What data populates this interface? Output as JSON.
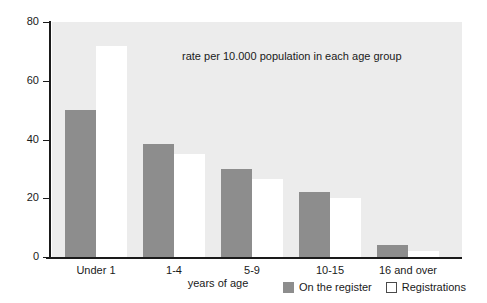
{
  "chart_data": {
    "type": "bar",
    "title": "",
    "subtitle": "",
    "annotation": "rate per 10.000 population in each age group",
    "xlabel": "years of age",
    "ylabel": "",
    "categories": [
      "Under 1",
      "1-4",
      "5-9",
      "10-15",
      "16 and over"
    ],
    "series": [
      {
        "name": "On the register",
        "color": "#8d8d8d",
        "values": [
          50,
          38.5,
          30,
          22,
          4
        ]
      },
      {
        "name": "Registrations",
        "color": "#ffffff",
        "values": [
          72,
          35,
          26.5,
          20,
          2
        ]
      }
    ],
    "ylim": [
      0,
      80
    ],
    "yticks": [
      0,
      20,
      40,
      60,
      80
    ],
    "ytick_labels": [
      "0",
      "20",
      "40",
      "60",
      "80"
    ],
    "grid": false,
    "legend_position": "bottom-right",
    "plot_background": "#ececec"
  },
  "legend": {
    "entries": [
      {
        "label": "On the register",
        "swatch": "filled"
      },
      {
        "label": "Registrations",
        "swatch": "outlined"
      }
    ]
  }
}
